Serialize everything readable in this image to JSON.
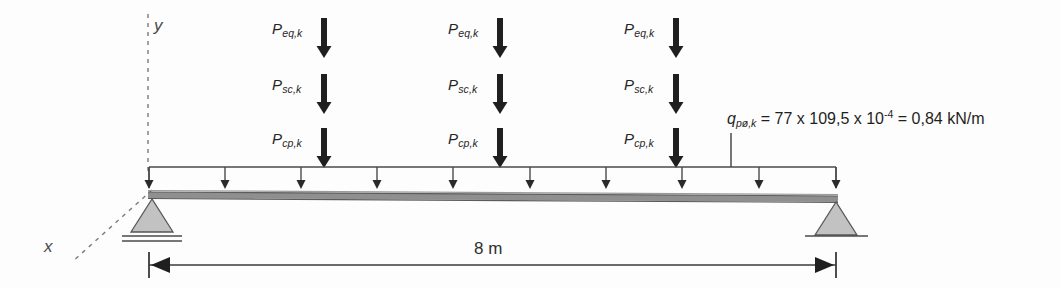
{
  "figure": {
    "span_label": "8 m",
    "axes": {
      "y_label": "y",
      "x_label": "x"
    },
    "point_load_groups": [
      {
        "position_label": "group-1",
        "loads": [
          {
            "symbol": "P",
            "subscript": "eq,k"
          },
          {
            "symbol": "P",
            "subscript": "sc,k"
          },
          {
            "symbol": "P",
            "subscript": "cp,k"
          }
        ]
      },
      {
        "position_label": "group-2",
        "loads": [
          {
            "symbol": "P",
            "subscript": "eq,k"
          },
          {
            "symbol": "P",
            "subscript": "sc,k"
          },
          {
            "symbol": "P",
            "subscript": "cp,k"
          }
        ]
      },
      {
        "position_label": "group-3",
        "loads": [
          {
            "symbol": "P",
            "subscript": "eq,k"
          },
          {
            "symbol": "P",
            "subscript": "sc,k"
          },
          {
            "symbol": "P",
            "subscript": "cp,k"
          }
        ]
      }
    ],
    "distributed_load": {
      "symbol": "q",
      "subscript": "pø,k",
      "equation": "= 77 x 109,5 x 10",
      "exponent": "-4",
      "result": "= 0,84 kN/m"
    },
    "colors": {
      "line": "#3a3a3a",
      "beam_fill": "#8f8f8f",
      "support_fill": "#b9b9b9",
      "text": "#262626"
    }
  }
}
